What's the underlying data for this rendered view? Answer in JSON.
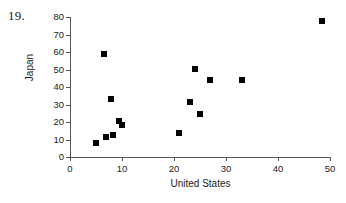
{
  "problem": {
    "number": "19."
  },
  "chart_data": {
    "type": "scatter",
    "title": "",
    "xlabel": "United States",
    "ylabel": "Japan",
    "xlim": [
      0,
      50
    ],
    "ylim": [
      0,
      80
    ],
    "xticks": [
      0,
      10,
      20,
      30,
      40,
      50
    ],
    "yticks": [
      0,
      10,
      20,
      30,
      40,
      50,
      60,
      70,
      80
    ],
    "grid": false,
    "legend": false,
    "marker": "filled-square",
    "marker_color": "#000000",
    "points": [
      {
        "x": 5.0,
        "y": 8.0
      },
      {
        "x": 6.6,
        "y": 59.0
      },
      {
        "x": 7.0,
        "y": 11.5
      },
      {
        "x": 7.8,
        "y": 33.0
      },
      {
        "x": 8.3,
        "y": 12.5
      },
      {
        "x": 9.5,
        "y": 20.5
      },
      {
        "x": 10.0,
        "y": 18.5
      },
      {
        "x": 21.0,
        "y": 14.0
      },
      {
        "x": 23.0,
        "y": 31.5
      },
      {
        "x": 24.0,
        "y": 50.5
      },
      {
        "x": 25.0,
        "y": 24.5
      },
      {
        "x": 27.0,
        "y": 44.0
      },
      {
        "x": 33.0,
        "y": 44.0
      },
      {
        "x": 48.5,
        "y": 77.5
      }
    ]
  }
}
